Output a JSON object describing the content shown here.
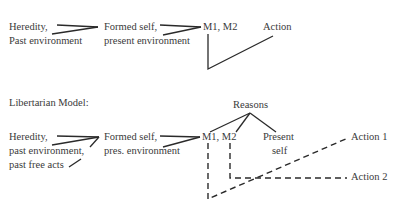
{
  "determinist_model": {
    "inputs": {
      "line1": "Heredity,",
      "line2": "Past environment"
    },
    "formed": {
      "line1": "Formed self,",
      "line2": "present environment"
    },
    "motives": "M1,  M2",
    "action": "Action"
  },
  "libertarian_model": {
    "title": "Libertarian Model:",
    "inputs": {
      "line1": "Heredity,",
      "line2": "past environment,",
      "line3": "past free acts"
    },
    "formed": {
      "line1": "Formed self,",
      "line2": "pres.  environment"
    },
    "reasons": "Reasons",
    "motives": "M1, M2",
    "present_self": {
      "line1": "Present",
      "line2": "self"
    },
    "action1": "Action 1",
    "action2": "Action 2"
  },
  "colors": {
    "line": "#2a2a2a",
    "text": "#3a3a3a",
    "background": "#ffffff"
  }
}
